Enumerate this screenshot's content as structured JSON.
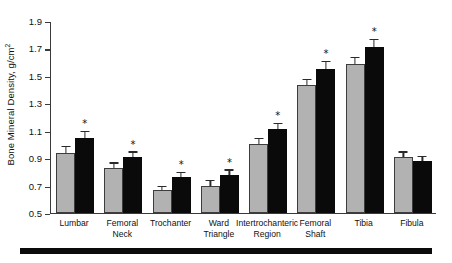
{
  "chart_data": {
    "type": "bar",
    "title": "",
    "xlabel": "",
    "ylabel": "Bone Mineral Density, g/cm",
    "ylabel_superscript": "2",
    "ylim": [
      0.5,
      1.9
    ],
    "yticks": [
      0.5,
      0.7,
      0.9,
      1.1,
      1.3,
      1.5,
      1.7,
      1.9
    ],
    "ytick_labels": [
      "0.5",
      "0.7",
      "0.9",
      "1.1",
      "1.3",
      "1.5",
      "1.7",
      "1.9"
    ],
    "grid": false,
    "legend_position": "none",
    "categories": [
      "Lumbar",
      "Femoral Neck",
      "Trochanter",
      "Ward Triangle",
      "Intertrochanteric Region",
      "Femoral Shaft",
      "Tibia",
      "Fibula"
    ],
    "category_lines": [
      [
        "Lumbar"
      ],
      [
        "Femoral",
        "Neck"
      ],
      [
        "Trochanter"
      ],
      [
        "Ward",
        "Triangle"
      ],
      [
        "Intertrochanteric",
        "Region"
      ],
      [
        "Femoral",
        "Shaft"
      ],
      [
        "Tibia"
      ],
      [
        "Fibula"
      ]
    ],
    "series": [
      {
        "name": "gray",
        "color": "#b2b2b2",
        "values": [
          0.94,
          0.83,
          0.67,
          0.7,
          1.0,
          1.43,
          1.59,
          0.91
        ],
        "errors": [
          0.04,
          0.03,
          0.02,
          0.03,
          0.04,
          0.04,
          0.04,
          0.03
        ],
        "significant": [
          false,
          false,
          false,
          false,
          false,
          false,
          false,
          false
        ]
      },
      {
        "name": "black",
        "color": "#0a0a0a",
        "values": [
          1.05,
          0.91,
          0.76,
          0.78,
          1.11,
          1.55,
          1.71,
          0.88
        ],
        "errors": [
          0.04,
          0.03,
          0.03,
          0.03,
          0.04,
          0.05,
          0.05,
          0.03
        ],
        "significant": [
          true,
          true,
          true,
          true,
          true,
          true,
          true,
          false
        ]
      }
    ],
    "annotations": {
      "significance_marker": "*",
      "significance_note": "Asterisk denotes significant difference versus comparison group"
    }
  }
}
